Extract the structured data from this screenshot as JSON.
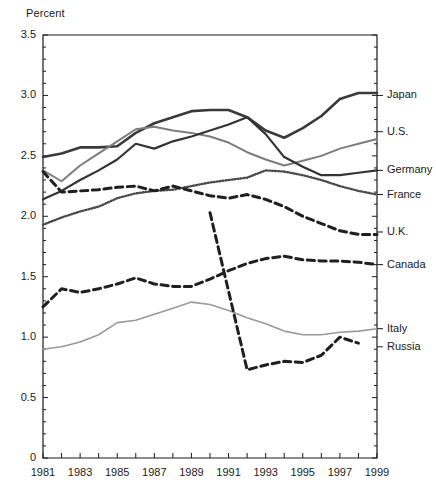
{
  "chart_data": {
    "type": "line",
    "title": "",
    "subtitle": "",
    "ylabel": "Percent",
    "xlabel": "",
    "xlim": [
      1981,
      1999
    ],
    "ylim": [
      0,
      3.5
    ],
    "ytick_labels": [
      "0",
      "0.5",
      "1.0",
      "1.5",
      "2.0",
      "2.5",
      "3.0",
      "3.5"
    ],
    "ytick_values": [
      0,
      0.5,
      1.0,
      1.5,
      2.0,
      2.5,
      3.0,
      3.5
    ],
    "yminor_step": 0.1,
    "xtick_labels": [
      "1981",
      "1983",
      "1985",
      "1987",
      "1989",
      "1991",
      "1993",
      "1995",
      "1997",
      "1999"
    ],
    "xtick_values": [
      1981,
      1983,
      1985,
      1987,
      1989,
      1991,
      1993,
      1995,
      1997,
      1999
    ],
    "xminor_step": 1,
    "grid": false,
    "legend_position": "right-inline",
    "x": [
      1981,
      1982,
      1983,
      1984,
      1985,
      1986,
      1987,
      1988,
      1989,
      1990,
      1991,
      1992,
      1993,
      1994,
      1995,
      1996,
      1997,
      1998,
      1999
    ],
    "series": [
      {
        "name": "Japan",
        "label": "Japan",
        "style": "solid",
        "color": "#3a3a3a",
        "width": 2.6,
        "label_y": 3.0,
        "values": [
          2.49,
          2.52,
          2.57,
          2.57,
          2.58,
          2.69,
          2.77,
          2.82,
          2.87,
          2.88,
          2.88,
          2.82,
          2.71,
          2.65,
          2.73,
          2.83,
          2.97,
          3.02,
          3.02
        ]
      },
      {
        "name": "U.S.",
        "label": "U.S.",
        "style": "solid",
        "color": "#7d7d7d",
        "width": 2.0,
        "label_y": 2.7,
        "values": [
          2.38,
          2.29,
          2.42,
          2.52,
          2.62,
          2.72,
          2.74,
          2.71,
          2.69,
          2.66,
          2.61,
          2.53,
          2.47,
          2.42,
          2.46,
          2.5,
          2.56,
          2.6,
          2.64
        ]
      },
      {
        "name": "Germany",
        "label": "Germany",
        "style": "solid",
        "color": "#333333",
        "width": 2.2,
        "label_y": 2.38,
        "values": [
          2.14,
          2.21,
          2.3,
          2.38,
          2.47,
          2.6,
          2.56,
          2.62,
          2.66,
          2.71,
          2.76,
          2.82,
          2.68,
          2.49,
          2.41,
          2.34,
          2.34,
          2.36,
          2.38
        ]
      },
      {
        "name": "France",
        "label": "France",
        "style": "dotted",
        "color": "#4a4a4a",
        "width": 2.4,
        "label_y": 2.18,
        "values": [
          1.93,
          1.99,
          2.04,
          2.08,
          2.15,
          2.19,
          2.21,
          2.22,
          2.25,
          2.28,
          2.3,
          2.32,
          2.38,
          2.37,
          2.34,
          2.3,
          2.25,
          2.21,
          2.18
        ]
      },
      {
        "name": "U.K.",
        "label": "U.K.",
        "style": "dashed",
        "color": "#1f1f1f",
        "width": 3.0,
        "label_y": 1.87,
        "values": [
          2.37,
          2.2,
          2.21,
          2.22,
          2.24,
          2.25,
          2.21,
          2.25,
          2.21,
          2.17,
          2.15,
          2.18,
          2.14,
          2.08,
          2.0,
          1.94,
          1.88,
          1.85,
          1.85
        ]
      },
      {
        "name": "Canada",
        "label": "Canada",
        "style": "dashed",
        "color": "#202020",
        "width": 3.0,
        "label_y": 1.6,
        "values": [
          1.25,
          1.4,
          1.37,
          1.4,
          1.44,
          1.49,
          1.44,
          1.42,
          1.42,
          1.48,
          1.55,
          1.61,
          1.65,
          1.67,
          1.64,
          1.63,
          1.63,
          1.62,
          1.6
        ]
      },
      {
        "name": "Italy",
        "label": "Italy",
        "style": "solid",
        "color": "#9a9a9a",
        "width": 1.6,
        "label_y": 1.07,
        "values": [
          0.9,
          0.92,
          0.96,
          1.02,
          1.12,
          1.14,
          1.19,
          1.24,
          1.29,
          1.27,
          1.22,
          1.16,
          1.11,
          1.05,
          1.02,
          1.02,
          1.04,
          1.05,
          1.07
        ]
      },
      {
        "name": "Russia",
        "label": "Russia",
        "style": "dashed",
        "color": "#1f1f1f",
        "width": 3.0,
        "label_y": 0.92,
        "values": [
          null,
          null,
          null,
          null,
          null,
          null,
          null,
          null,
          null,
          2.03,
          1.38,
          0.73,
          0.77,
          0.8,
          0.79,
          0.85,
          1.0,
          0.95,
          null
        ]
      }
    ]
  }
}
